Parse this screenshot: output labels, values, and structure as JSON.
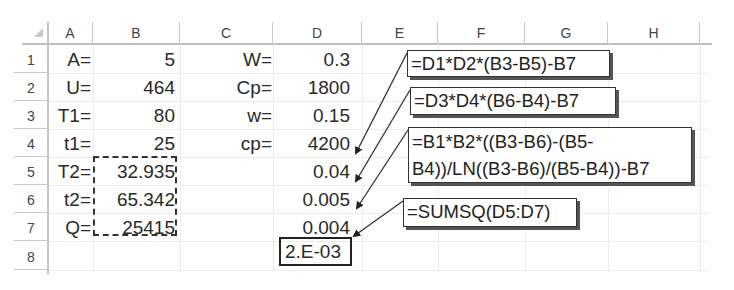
{
  "spreadsheet": {
    "column_headers": [
      "A",
      "B",
      "C",
      "D",
      "E",
      "F",
      "G",
      "H"
    ],
    "row_headers": [
      "1",
      "2",
      "3",
      "4",
      "5",
      "6",
      "7",
      "8"
    ],
    "cells": {
      "A1": "A=",
      "B1": "5",
      "C1": "W=",
      "D1": "0.3",
      "A2": "U=",
      "B2": "464",
      "C2": "Cp=",
      "D2": "1800",
      "A3": "T1=",
      "B3": "80",
      "C3": "w=",
      "D3": "0.15",
      "A4": "t1=",
      "B4": "25",
      "C4": "cp=",
      "D4": "4200",
      "A5": "T2=",
      "B5": "32.935",
      "D5": "0.04",
      "A6": "t2=",
      "B6": "65.342",
      "D6": "0.005",
      "A7": "Q=",
      "B7": "25415",
      "D7": "0.004",
      "D8": "2.E-03"
    },
    "callouts": [
      {
        "target": "D5",
        "formula": "=D1*D2*(B3-B5)-B7"
      },
      {
        "target": "D6",
        "formula": "=D3*D4*(B6-B4)-B7"
      },
      {
        "target": "D7",
        "formula_line1": "=B1*B2*((B3-B6)-(B5-",
        "formula_line2": "B4))/LN((B3-B6)/(B5-B4))-B7"
      },
      {
        "target": "D8",
        "formula": "=SUMSQ(D5:D7)"
      }
    ],
    "highlights": {
      "dashed_range": "B5:B7",
      "solid_cell": "D8"
    }
  }
}
